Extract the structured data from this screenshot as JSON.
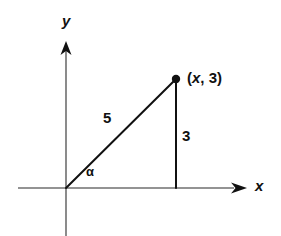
{
  "figure": {
    "type": "right-triangle-in-coordinate-plane",
    "background_color": "#ffffff",
    "stroke_color": "#111111"
  },
  "axes": {
    "y_label": "y",
    "x_label": "x",
    "y_axis": {
      "x": 66,
      "top": 42,
      "bottom": 236,
      "arrow": "up"
    },
    "x_axis": {
      "y": 188,
      "left": 18,
      "right": 246,
      "arrow": "right"
    },
    "origin": {
      "x": 66,
      "y": 188
    }
  },
  "triangle": {
    "vertices": {
      "origin": {
        "x": 66,
        "y": 188
      },
      "point": {
        "x": 176,
        "y": 79
      },
      "foot": {
        "x": 176,
        "y": 188
      }
    },
    "hypotenuse_label": "5",
    "opposite_label": "3",
    "angle_label": "α",
    "point_label": {
      "open_paren": "(",
      "variable": "x",
      "separator": ", ",
      "value": "3",
      "close_paren": ")"
    }
  }
}
